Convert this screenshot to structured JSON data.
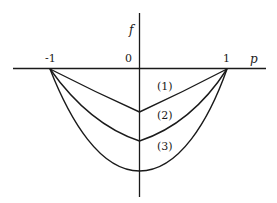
{
  "diagram": {
    "axes": {
      "x_label": "p",
      "y_label": "f",
      "origin_label": "0",
      "ticks": [
        {
          "label": "-1",
          "value": -1
        },
        {
          "label": "1",
          "value": 1
        }
      ]
    },
    "curves": [
      {
        "id": "1",
        "label": "(1)",
        "shape": "V-shaped, nearly straight segments",
        "vertex_depth": 0.24
      },
      {
        "id": "2",
        "label": "(2)",
        "shape": "slightly curved with cusp at p=0",
        "vertex_depth": 0.41
      },
      {
        "id": "3",
        "label": "(3)",
        "shape": "smooth parabola",
        "vertex_depth": 0.58
      }
    ],
    "colors": {
      "line": "#1a1a1a",
      "background": "#ffffff"
    }
  }
}
